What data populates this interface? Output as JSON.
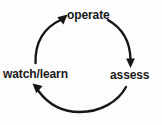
{
  "diagram": {
    "type": "cycle-diagram",
    "background_color": "#fdfdfd",
    "stroke_color": "#161616",
    "text_color": "#191919",
    "nodes": [
      {
        "id": "operate",
        "label": "operate",
        "position": "top"
      },
      {
        "id": "assess",
        "label": "assess",
        "position": "right"
      },
      {
        "id": "watch_learn",
        "label": "watch/learn",
        "position": "left"
      }
    ],
    "edges": [
      {
        "id": "operate-to-assess",
        "from": "operate",
        "to": "assess",
        "arrow": "down"
      },
      {
        "id": "assess-to-watch-learn",
        "from": "assess",
        "to": "watch_learn",
        "arrow": "up-left"
      },
      {
        "id": "watch-learn-to-operate",
        "from": "watch_learn",
        "to": "operate",
        "arrow": "up-right"
      }
    ]
  }
}
